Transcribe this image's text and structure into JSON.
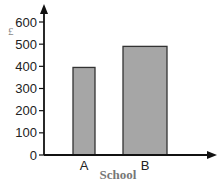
{
  "chart_data": {
    "type": "bar",
    "title": "",
    "xlabel": "School",
    "ylabel": "£",
    "categories": [
      "A",
      "B"
    ],
    "values": [
      395,
      490
    ],
    "ylim": [
      0,
      600
    ],
    "yticks": [
      0,
      100,
      200,
      300,
      400,
      500,
      600
    ],
    "grid": false,
    "legend": null,
    "bar_color": "#a6a6a6",
    "bar_edge_color": "#333333"
  }
}
